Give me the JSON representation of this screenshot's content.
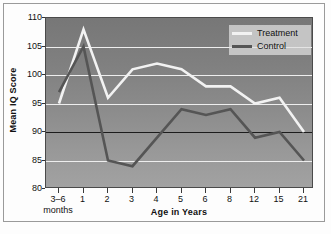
{
  "chart_data": {
    "type": "line",
    "title": "",
    "xlabel": "Age in Years",
    "ylabel": "Mean IQ Score",
    "ylim": [
      80,
      110
    ],
    "yticks": [
      80,
      85,
      90,
      95,
      100,
      105,
      110
    ],
    "grid": true,
    "reference_line": 90,
    "legend_position": "top-right",
    "categories": [
      "3–6\nmonths",
      "1",
      "2",
      "3",
      "4",
      "5",
      "6",
      "8",
      "12",
      "15",
      "21"
    ],
    "category_labels": [
      {
        "main": "3–6",
        "sub": "months"
      },
      {
        "main": "1",
        "sub": ""
      },
      {
        "main": "2",
        "sub": ""
      },
      {
        "main": "3",
        "sub": ""
      },
      {
        "main": "4",
        "sub": ""
      },
      {
        "main": "5",
        "sub": ""
      },
      {
        "main": "6",
        "sub": ""
      },
      {
        "main": "8",
        "sub": ""
      },
      {
        "main": "12",
        "sub": ""
      },
      {
        "main": "15",
        "sub": ""
      },
      {
        "main": "21",
        "sub": ""
      }
    ],
    "series": [
      {
        "name": "Treatment",
        "color": "#f2f2f2",
        "values": [
          95,
          108,
          96,
          101,
          102,
          101,
          98,
          98,
          95,
          96,
          90
        ]
      },
      {
        "name": "Control",
        "color": "#555555",
        "values": [
          97,
          105,
          85,
          84,
          89,
          94,
          93,
          94,
          89,
          90,
          85
        ]
      }
    ]
  },
  "legend": {
    "entries": [
      {
        "label": "Treatment"
      },
      {
        "label": "Control"
      }
    ]
  },
  "axes": {
    "y_title": "Mean IQ Score",
    "x_title": "Age in Years"
  },
  "colors": {
    "treatment": "#f2f2f2",
    "control": "#555555",
    "gridline": "#eeeeee",
    "reference_line": "#1c1c1c",
    "plot_bg_top": "#777777",
    "plot_bg_bottom": "#a2a2a2",
    "frame": "#9a9a9a"
  }
}
